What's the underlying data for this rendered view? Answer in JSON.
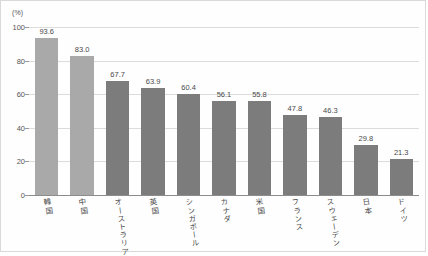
{
  "chart_data": {
    "type": "bar",
    "title": "",
    "subtitle": "",
    "xlabel": "",
    "ylabel": "(%)",
    "unit_label": "(%)",
    "ylim": [
      0,
      100
    ],
    "yticks": [
      0,
      20,
      40,
      60,
      80,
      100
    ],
    "ytick_labels": [
      "0",
      "20",
      "40",
      "60",
      "80",
      "100"
    ],
    "grid": true,
    "legend": "none",
    "categories": [
      "韓国",
      "中国",
      "オーストラリア",
      "英国",
      "シンガポール",
      "カナダ",
      "米国",
      "フランス",
      "スウェーデン",
      "日本",
      "ドイツ"
    ],
    "values": [
      93.6,
      83.0,
      67.7,
      63.9,
      60.4,
      56.1,
      55.8,
      47.8,
      46.3,
      29.8,
      21.3
    ],
    "value_labels": [
      "93.6",
      "83.0",
      "67.7",
      "63.9",
      "60.4",
      "56.1",
      "55.8",
      "47.8",
      "46.3",
      "29.8",
      "21.3"
    ],
    "bar_colors": [
      "#a9a9a9",
      "#a9a9a9",
      "#7c7c7c",
      "#7c7c7c",
      "#7c7c7c",
      "#7c7c7c",
      "#7c7c7c",
      "#7c7c7c",
      "#7c7c7c",
      "#7c7c7c",
      "#7c7c7c"
    ],
    "colors": {
      "highlight_bar": "#a9a9a9",
      "standard_bar": "#7c7c7c",
      "gridline": "#dcdcdc",
      "axis": "#8c8c8c",
      "text": "#4a4a4a",
      "frame": "#d9d9d9",
      "background": "#fefefe"
    }
  }
}
